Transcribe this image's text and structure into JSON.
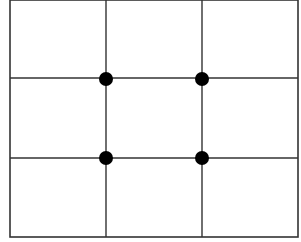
{
  "diagram": {
    "title": "",
    "type": "rule-of-thirds-grid",
    "frame": {
      "x": 10,
      "y": 0,
      "width": 288,
      "height": 237,
      "stroke": "#333333"
    },
    "vertical_lines_x": [
      106,
      202
    ],
    "horizontal_lines_y": [
      78,
      158
    ],
    "line_color": "#333333",
    "points": [
      {
        "x": 106,
        "y": 79,
        "r": 7
      },
      {
        "x": 202,
        "y": 79,
        "r": 7
      },
      {
        "x": 106,
        "y": 158,
        "r": 7
      },
      {
        "x": 202,
        "y": 158,
        "r": 7
      }
    ],
    "point_color": "#000000"
  }
}
